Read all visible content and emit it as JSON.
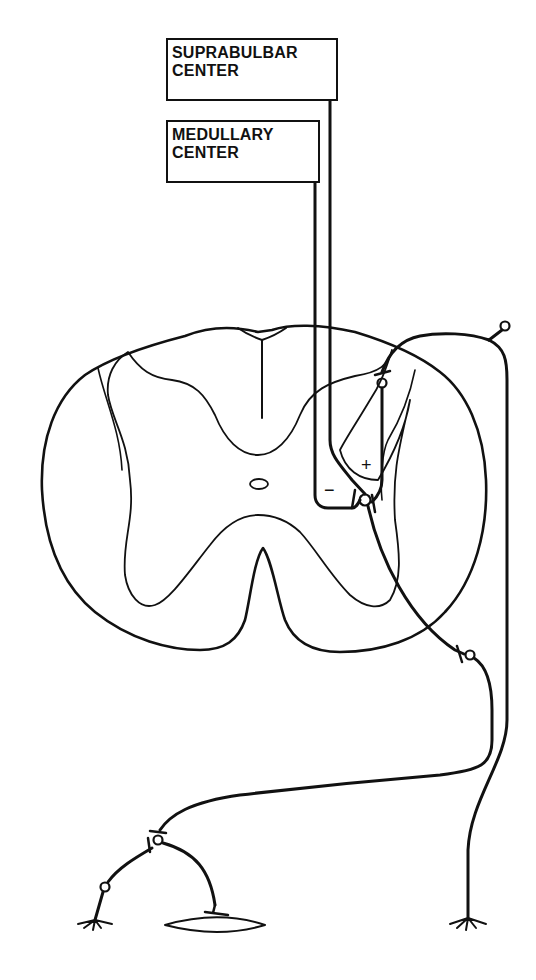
{
  "labels": {
    "suprabulbar": [
      "SUPRABULBAR",
      "CENTER"
    ],
    "medullary": [
      "MEDULLARY",
      "CENTER"
    ]
  },
  "signs": {
    "excitatory": "+",
    "inhibitory": "−"
  },
  "colors": {
    "ink": "#111111",
    "background": "#ffffff"
  }
}
